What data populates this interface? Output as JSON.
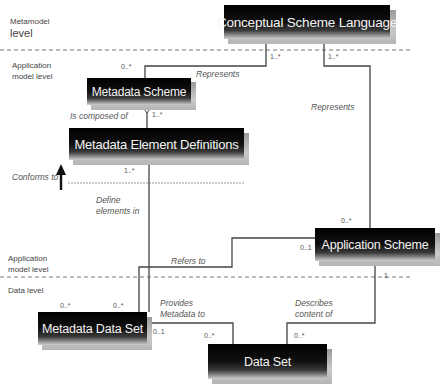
{
  "levels": {
    "metamodel": {
      "line1": "Metamodel",
      "line2": "level"
    },
    "application_top": {
      "line1": "Application",
      "line2": "model level"
    },
    "application_bottom": {
      "line1": "Application",
      "line2": "model level"
    },
    "data": "Data level"
  },
  "classes": {
    "conceptual_scheme_language": "Conceptual Scheme Language",
    "metadata_scheme": "Metadata Scheme",
    "metadata_element_definitions": "Metadata Element Definitions",
    "application_scheme": "Application Scheme",
    "metadata_data_set": "Metadata Data Set",
    "data_set": "Data Set"
  },
  "associations": {
    "represents_left": "Represents",
    "represents_right": "Represents",
    "is_composed_of": "Is composed of",
    "conforms_to": "Conforms to",
    "define_elements_in": {
      "line1": "Define",
      "line2": "elements in"
    },
    "refers_to": "Refers to",
    "provides_metadata_to": {
      "line1": "Provides",
      "line2": "Metadata to"
    },
    "describes_content_of": {
      "line1": "Describes",
      "line2": "content of"
    }
  },
  "multiplicities": {
    "csl_left": "1..*",
    "csl_right": "1..*",
    "ms_top": "0..*",
    "ms_bottom": "1..*",
    "med_bottom": "1..*",
    "as_top": "0..*",
    "as_left": "0..1",
    "as_bottom": "1",
    "mds_left": "0..*",
    "mds_right_top": "0..*",
    "mds_right": "0..1",
    "ds_left": "0..*",
    "ds_right": "0..*"
  },
  "colors": {
    "box_fill": "#000000",
    "box_text": "#f4f4f4",
    "line": "#444444",
    "dashed_line": "#777777"
  }
}
